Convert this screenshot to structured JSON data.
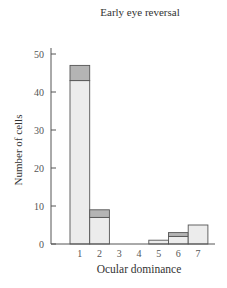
{
  "chart_data": {
    "type": "bar",
    "stacked": true,
    "title": "Early eye reversal",
    "xlabel": "Ocular dominance",
    "ylabel": "Number of cells",
    "categories": [
      "1",
      "2",
      "3",
      "4",
      "5",
      "6",
      "7"
    ],
    "series": [
      {
        "name": "light",
        "color": "#ececec",
        "values": [
          43,
          7,
          0,
          0,
          1,
          2,
          5
        ]
      },
      {
        "name": "dark",
        "color": "#b4b4b4",
        "values": [
          4,
          2,
          0,
          0,
          0,
          1,
          0
        ]
      }
    ],
    "yticks": [
      0,
      10,
      20,
      30,
      40,
      50
    ],
    "ylim": [
      0,
      52
    ],
    "grid": false,
    "legend": "none"
  }
}
